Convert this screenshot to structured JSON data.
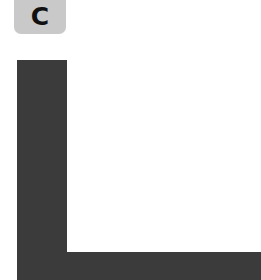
{
  "panel_label": {
    "text": "C",
    "background": "#c9c9c9",
    "color": "#111111"
  },
  "shape": {
    "description": "L-shaped dark bar",
    "color": "#3b3b3b"
  }
}
